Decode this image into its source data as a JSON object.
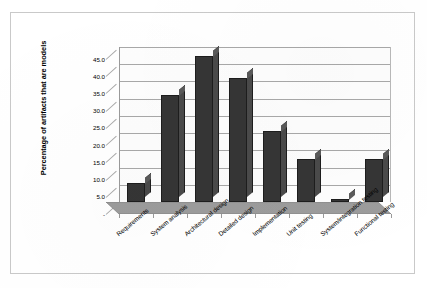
{
  "chart_data": {
    "type": "bar",
    "title": "",
    "subtitle": "",
    "xlabel": "",
    "ylabel": "Percentage of artifacts that are models",
    "ylim": [
      0,
      45
    ],
    "ytick_labels": [
      "45.0",
      "40.0",
      "35.0",
      "30.0",
      "25.0",
      "20.0",
      "15.0",
      "10.0",
      "5.0",
      "-"
    ],
    "ytick_values": [
      45,
      40,
      35,
      30,
      25,
      20,
      15,
      10,
      5,
      0
    ],
    "grid": true,
    "legend": "none",
    "three_d": true,
    "categories": [
      "Requirements",
      "System analysis",
      "Architectural design",
      "Detailed design",
      "Implementation",
      "Unit testing",
      "System/integration testing",
      "Functional testing"
    ],
    "values": [
      5.5,
      31.0,
      42.5,
      36.0,
      20.5,
      12.5,
      1.0,
      12.5
    ],
    "series": [
      {
        "name": "Percentage of artifacts that are models",
        "values": [
          5.5,
          31.0,
          42.5,
          36.0,
          20.5,
          12.5,
          1.0,
          12.5
        ]
      }
    ],
    "colors": {
      "bar_front": "#353535",
      "bar_side": "#4a4a4a",
      "bar_top": "#5a5a5a",
      "bar_outline": "#1d1d1d",
      "gridline": "#a8a8a8",
      "plot_background": "#fdfdfd",
      "floor": "#9c9c9c",
      "frame_border": "#c9c9c9",
      "text": "#000000"
    }
  }
}
